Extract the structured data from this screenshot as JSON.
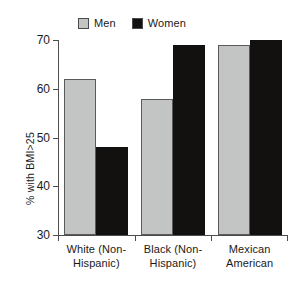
{
  "chart_data": {
    "type": "bar",
    "title": "",
    "xlabel": "",
    "ylabel": "% with BMI>25",
    "ylim": [
      30,
      70
    ],
    "yticks": [
      30,
      40,
      50,
      60,
      70
    ],
    "ytick_labels": [
      "30",
      "40",
      "50",
      "60",
      "70"
    ],
    "grid": false,
    "legend_position": "top",
    "categories": [
      "White (Non-Hispanic)",
      "Black (Non-Hispanic)",
      "Mexican American"
    ],
    "category_lines": [
      [
        "White (Non-",
        "Hispanic)"
      ],
      [
        "Black (Non-",
        "Hispanic)"
      ],
      [
        "Mexican",
        "American"
      ]
    ],
    "series": [
      {
        "name": "Men",
        "color": "#c3c4c4",
        "values": [
          62,
          58,
          69
        ]
      },
      {
        "name": "Women",
        "color": "#121110",
        "values": [
          48,
          69,
          70
        ]
      }
    ]
  },
  "legend": {
    "entries": [
      {
        "label": "Men",
        "swatch": "legend-swatch-men"
      },
      {
        "label": "Women",
        "swatch": "legend-swatch-women"
      }
    ]
  },
  "axes": {
    "y_title": "% with BMI>25"
  }
}
